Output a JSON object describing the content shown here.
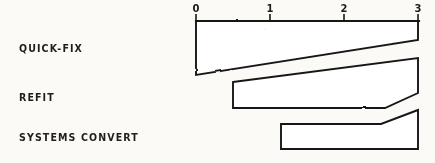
{
  "chart_data": {
    "type": "bar",
    "title": "",
    "xlabel": "",
    "ylabel": "",
    "orientation": "horizontal",
    "grid": false,
    "legend": null,
    "xlim": [
      0,
      3
    ],
    "xticks": [
      "0",
      "1",
      "2",
      "3"
    ],
    "axis_position": "top",
    "categories": [
      "QUICK-FIX",
      "REFIT",
      "SYSTEMS CONVERT"
    ],
    "values": [
      3,
      2.5,
      1.85
    ],
    "bars": [
      {
        "label": "QUICK-FIX",
        "start": 0,
        "end": 3,
        "shape": "taper-bottom-right",
        "polygon": "196,21 418,21 418,40 196,75"
      },
      {
        "label": "REFIT",
        "start": 0.5,
        "end": 3,
        "shape": "taper-top-right-chamfer-bottom-right",
        "polygon": "233,82 418,58 418,93 385,108 233,108"
      },
      {
        "label": "SYSTEMS CONVERT",
        "start": 1.15,
        "end": 3,
        "shape": "chamfer-top-right",
        "polygon": "281,124 381,124 418,110 418,149 281,149"
      }
    ],
    "ticks": [
      {
        "label": "0",
        "x": 196
      },
      {
        "label": "1",
        "x": 270
      },
      {
        "label": "2",
        "x": 344
      },
      {
        "label": "3",
        "x": 418
      }
    ],
    "colors": {
      "background": "#fbfaf7",
      "ink": "#191715",
      "bar_fill": "#ffffff"
    }
  }
}
